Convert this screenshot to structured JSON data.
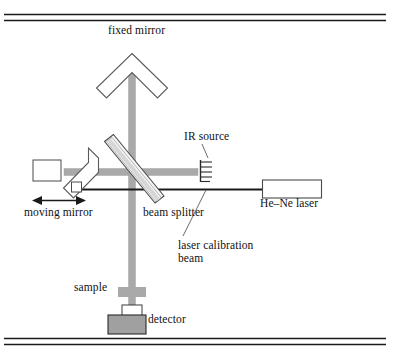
{
  "figure": {
    "kind": "schematic-diagram",
    "width": 404,
    "height": 353,
    "background_color": "#ffffff",
    "rule_color": "#1a1a1a"
  },
  "labels": {
    "fixed_mirror": "fixed mirror",
    "ir_source": "IR source",
    "hene_laser": "He–Ne laser",
    "moving_mirror": "moving mirror",
    "beam_splitter": "beam splitter",
    "laser_calibration_beam": "laser calibration\nbeam",
    "laser_calibration_beam_line1": "laser calibration",
    "laser_calibration_beam_line2": "beam",
    "sample": "sample",
    "detector": "detector"
  },
  "colors": {
    "ir_beam": "#a9a9a9",
    "ir_beam_edge": "#8c8c8c",
    "laser_beam": "#1a1a1a",
    "outline": "#4a4a4a",
    "optic_fill": "#ffffff",
    "beamsplitter_fill": "#f2f2f2",
    "beamsplitter_core": "#d8d8d8",
    "detector_fill": "#a0a0a0",
    "detector_window_fill": "#ffffff",
    "sample_fill": "#a9a9a9",
    "text": "#111111"
  },
  "components": [
    {
      "name": "fixed-mirror",
      "type": "retroreflector",
      "label": "fixed mirror",
      "position": "top-center"
    },
    {
      "name": "moving-mirror",
      "type": "retroreflector",
      "label": "moving mirror",
      "position": "left",
      "annotation": "double-headed horizontal translation arrow"
    },
    {
      "name": "beam-splitter",
      "type": "plate",
      "label": "beam splitter",
      "position": "center",
      "orientation": "45-degree diagonal"
    },
    {
      "name": "ir-source",
      "type": "coil-filament",
      "label": "IR source",
      "position": "center-right"
    },
    {
      "name": "hene-laser",
      "type": "box",
      "label": "He–Ne laser",
      "position": "right"
    },
    {
      "name": "sample",
      "type": "cross-cell",
      "label": "sample",
      "position": "bottom-center"
    },
    {
      "name": "detector",
      "type": "box",
      "label": "detector",
      "position": "bottom-center"
    }
  ],
  "beams": [
    {
      "name": "ir-beam",
      "color": "#a9a9a9",
      "width_px": 7,
      "path": "IR source → beam splitter → fixed mirror / moving mirror → sample → detector"
    },
    {
      "name": "laser-calibration-beam",
      "color": "#1a1a1a",
      "width_px": 2,
      "path": "He–Ne laser → beam splitter → moving mirror"
    }
  ],
  "rules": {
    "top": "double horizontal rule",
    "bottom": "double horizontal rule"
  }
}
